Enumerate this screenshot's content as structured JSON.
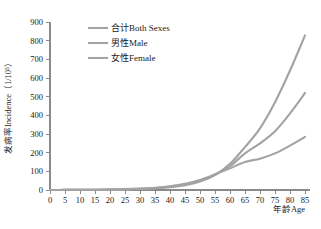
{
  "chart_data": {
    "type": "line",
    "title": "",
    "xlabel": "年龄Age",
    "ylabel": "发病率Incidence（1/10⁵）",
    "xlim": [
      0,
      85
    ],
    "ylim": [
      0,
      900
    ],
    "grid": false,
    "legend_position": "top-left-inside",
    "x": [
      0,
      5,
      10,
      15,
      20,
      25,
      30,
      35,
      40,
      45,
      50,
      55,
      60,
      65,
      70,
      75,
      80,
      85
    ],
    "xticks": [
      "0",
      "5",
      "10",
      "15",
      "20",
      "25",
      "30",
      "35",
      "40",
      "45",
      "50",
      "55",
      "60",
      "65",
      "70",
      "75",
      "80",
      "85"
    ],
    "yticks": [
      "0",
      "100",
      "200",
      "300",
      "400",
      "500",
      "600",
      "700",
      "800",
      "900"
    ],
    "series": [
      {
        "name": "合计Both Sexes",
        "color": "#a3a3a3",
        "values": [
          0,
          0.5,
          1,
          1.5,
          2.5,
          4,
          6.5,
          10,
          17,
          29,
          50,
          82,
          128,
          196,
          250,
          315,
          410,
          520
        ]
      },
      {
        "name": "男性Male",
        "color": "#a3a3a3",
        "values": [
          0,
          0.5,
          1,
          1.5,
          2.5,
          3.5,
          5.5,
          9,
          15,
          26,
          46,
          80,
          140,
          230,
          330,
          470,
          640,
          828
        ]
      },
      {
        "name": "女性Female",
        "color": "#a3a3a3",
        "values": [
          0,
          0.5,
          1,
          1.5,
          2.5,
          4.5,
          7.5,
          12,
          20,
          33,
          54,
          84,
          116,
          150,
          168,
          196,
          238,
          285
        ]
      }
    ],
    "legend": [
      {
        "label": "合计Both Sexes"
      },
      {
        "label": "男性Male"
      },
      {
        "label": "女性Female"
      }
    ]
  }
}
